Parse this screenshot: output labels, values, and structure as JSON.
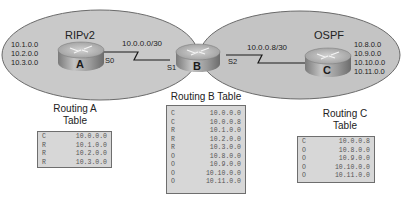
{
  "colors": {
    "ellipse_fill": "#c9c9c9",
    "ellipse_stroke": "#6a6a6a",
    "table_fill": "#d7d7d7",
    "table_border": "#6e6e6e",
    "router_top": "#bdbdbd",
    "router_side": "#8f8f8f"
  },
  "domains": {
    "rip": {
      "label": "RIPv2"
    },
    "ospf": {
      "label": "OSPF"
    }
  },
  "routers": {
    "A": {
      "letter": "A",
      "networks": [
        "10.1.0.0",
        "10.2.0.0",
        "10.3.0.0"
      ],
      "interface": "S0"
    },
    "B": {
      "letter": "B",
      "interfaces": {
        "left": "S1",
        "right": "S2"
      }
    },
    "C": {
      "letter": "C",
      "networks": [
        "10.8.0.0",
        "10.9.0.0",
        "10.10.0.0",
        "10.11.0.0"
      ]
    }
  },
  "links": {
    "ab": {
      "subnet": "10.0.0.0/30"
    },
    "bc": {
      "subnet": "10.0.0.8/30"
    }
  },
  "tables": {
    "A": {
      "title_line1": "Routing A",
      "title_line2": "Table",
      "rows": [
        {
          "code": "C",
          "network": "10.0.0.0"
        },
        {
          "code": "R",
          "network": "10.1.0.0"
        },
        {
          "code": "R",
          "network": "10.2.0.0"
        },
        {
          "code": "R",
          "network": "10.3.0.0"
        }
      ]
    },
    "B": {
      "title": "Routing B Table",
      "rows": [
        {
          "code": "C",
          "network": "10.0.0.0"
        },
        {
          "code": "C",
          "network": "10.0.0.8"
        },
        {
          "code": "R",
          "network": "10.1.0.0"
        },
        {
          "code": "R",
          "network": "10.2.0.0"
        },
        {
          "code": "R",
          "network": "10.3.0.0"
        },
        {
          "code": "O",
          "network": "10.8.0.0"
        },
        {
          "code": "O",
          "network": "10.9.0.0"
        },
        {
          "code": "O",
          "network": "10.10.0.0"
        },
        {
          "code": "O",
          "network": "10.11.0.0"
        }
      ]
    },
    "C": {
      "title_line1": "Routing C",
      "title_line2": "Table",
      "rows": [
        {
          "code": "C",
          "network": "10.0.0.8"
        },
        {
          "code": "O",
          "network": "10.8.0.0"
        },
        {
          "code": "O",
          "network": "10.9.0.0"
        },
        {
          "code": "O",
          "network": "10.10.0.0"
        },
        {
          "code": "O",
          "network": "10.11.0.0"
        }
      ]
    }
  }
}
